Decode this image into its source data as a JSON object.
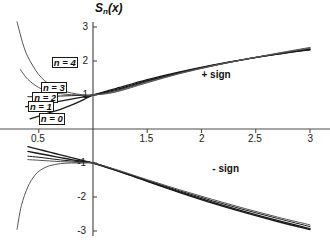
{
  "chart_data": {
    "type": "line",
    "title_parts": {
      "base": "S",
      "sub": "n",
      "arg": "(x)"
    },
    "xlabel": "",
    "ylabel": "S_n(x)",
    "xlim": [
      0.35,
      3.1
    ],
    "ylim": [
      -3.2,
      3.2
    ],
    "grid": false,
    "legend_position": "inline-left",
    "x_ticks": [
      {
        "value": 0.5,
        "label": "0.5"
      },
      {
        "value": 1.5,
        "label": "1.5"
      },
      {
        "value": 2.0,
        "label": "2"
      },
      {
        "value": 2.5,
        "label": "2.5"
      },
      {
        "value": 3.0,
        "label": "3"
      }
    ],
    "y_ticks": [
      {
        "value": 3,
        "label": "3"
      },
      {
        "value": 2,
        "label": "2"
      },
      {
        "value": 1,
        "label": "1"
      },
      {
        "value": -1,
        "label": "-1"
      },
      {
        "value": -2,
        "label": "-2"
      },
      {
        "value": -3,
        "label": "-3"
      }
    ],
    "annotations": [
      {
        "name": "plus-sign-label",
        "text": "+ sign",
        "x": 2.0,
        "y": 1.55
      },
      {
        "name": "minus-sign-label",
        "text": "- sign",
        "x": 2.1,
        "y": -1.2
      }
    ],
    "curve_labels": [
      {
        "name": "n4",
        "text": "n = 4",
        "x": 0.62,
        "y": 1.95
      },
      {
        "name": "n3",
        "text": "n = 3",
        "x": 0.52,
        "y": 1.22
      },
      {
        "name": "n2",
        "text": "n = 2",
        "x": 0.44,
        "y": 0.92
      },
      {
        "name": "n1",
        "text": "n = 1",
        "x": 0.4,
        "y": 0.66
      },
      {
        "name": "n0",
        "text": "n = 0",
        "x": 0.5,
        "y": 0.28
      }
    ],
    "series": [
      {
        "name": "n = 0 (+ sign)",
        "branch": "plus",
        "n": 0,
        "x": [
          0.42,
          0.5,
          0.6,
          0.7,
          0.8,
          0.9,
          1.0,
          1.2,
          1.5,
          1.8,
          2.1,
          2.4,
          2.7,
          3.0
        ],
        "y": [
          0.3,
          0.38,
          0.48,
          0.58,
          0.7,
          0.84,
          1.0,
          1.18,
          1.45,
          1.68,
          1.88,
          2.05,
          2.2,
          2.33
        ]
      },
      {
        "name": "n = 1 (+ sign)",
        "branch": "plus",
        "n": 1,
        "x": [
          0.38,
          0.5,
          0.6,
          0.7,
          0.8,
          0.9,
          1.0,
          1.2,
          1.5,
          1.8,
          2.1,
          2.4,
          2.7,
          3.0
        ],
        "y": [
          0.66,
          0.7,
          0.76,
          0.82,
          0.88,
          0.94,
          1.0,
          1.15,
          1.42,
          1.66,
          1.87,
          2.05,
          2.2,
          2.34
        ]
      },
      {
        "name": "n = 2 (+ sign)",
        "branch": "plus",
        "n": 2,
        "x": [
          0.4,
          0.5,
          0.6,
          0.7,
          0.8,
          0.9,
          1.0,
          1.2,
          1.5,
          1.8,
          2.1,
          2.4,
          2.7,
          3.0
        ],
        "y": [
          0.95,
          0.95,
          0.96,
          0.97,
          0.98,
          0.99,
          1.0,
          1.12,
          1.4,
          1.65,
          1.86,
          2.05,
          2.21,
          2.36
        ]
      },
      {
        "name": "n = 3 (+ sign)",
        "branch": "plus",
        "n": 3,
        "x": [
          0.33,
          0.4,
          0.5,
          0.6,
          0.7,
          0.8,
          0.9,
          1.0,
          1.2,
          1.5,
          1.8,
          2.1,
          2.4,
          2.7,
          3.0
        ],
        "y": [
          1.75,
          1.46,
          1.22,
          1.1,
          1.04,
          1.01,
          1.0,
          1.0,
          1.1,
          1.38,
          1.64,
          1.86,
          2.05,
          2.22,
          2.38
        ]
      },
      {
        "name": "n = 4 (+ sign)",
        "branch": "plus",
        "n": 4,
        "x": [
          0.3,
          0.35,
          0.4,
          0.5,
          0.6,
          0.7,
          0.8,
          0.9,
          1.0,
          1.2,
          1.5,
          1.8,
          2.1,
          2.4,
          2.7,
          3.0
        ],
        "y": [
          3.15,
          2.55,
          2.12,
          1.6,
          1.31,
          1.15,
          1.06,
          1.01,
          1.0,
          1.08,
          1.36,
          1.63,
          1.85,
          2.05,
          2.23,
          2.4
        ]
      },
      {
        "name": "n = 0 (- sign)",
        "branch": "minus",
        "n": 0,
        "x": [
          0.4,
          0.5,
          0.6,
          0.7,
          0.8,
          0.9,
          1.0,
          1.2,
          1.5,
          1.8,
          2.1,
          2.4,
          2.7,
          3.0
        ],
        "y": [
          -0.52,
          -0.6,
          -0.68,
          -0.76,
          -0.84,
          -0.92,
          -1.0,
          -1.2,
          -1.54,
          -1.87,
          -2.18,
          -2.46,
          -2.72,
          -2.96
        ]
      },
      {
        "name": "n = 1 (- sign)",
        "branch": "minus",
        "n": 1,
        "x": [
          0.4,
          0.5,
          0.6,
          0.7,
          0.8,
          0.9,
          1.0,
          1.2,
          1.5,
          1.8,
          2.1,
          2.4,
          2.7,
          3.0
        ],
        "y": [
          -0.66,
          -0.72,
          -0.78,
          -0.84,
          -0.9,
          -0.95,
          -1.0,
          -1.2,
          -1.53,
          -1.85,
          -2.15,
          -2.43,
          -2.69,
          -2.93
        ]
      },
      {
        "name": "n = 2 (- sign)",
        "branch": "minus",
        "n": 2,
        "x": [
          0.4,
          0.5,
          0.6,
          0.7,
          0.8,
          0.9,
          1.0,
          1.2,
          1.5,
          1.8,
          2.1,
          2.4,
          2.7,
          3.0
        ],
        "y": [
          -0.8,
          -0.83,
          -0.87,
          -0.91,
          -0.94,
          -0.97,
          -1.0,
          -1.19,
          -1.51,
          -1.82,
          -2.11,
          -2.38,
          -2.63,
          -2.87
        ]
      },
      {
        "name": "n = 3 (- sign)",
        "branch": "minus",
        "n": 3,
        "x": [
          0.4,
          0.5,
          0.6,
          0.7,
          0.8,
          0.9,
          1.0,
          1.2,
          1.5,
          1.8,
          2.1,
          2.4,
          2.7,
          3.0
        ],
        "y": [
          -0.9,
          -0.92,
          -0.94,
          -0.96,
          -0.97,
          -0.99,
          -1.0,
          -1.18,
          -1.49,
          -1.79,
          -2.07,
          -2.34,
          -2.59,
          -2.82
        ]
      },
      {
        "name": "n = 4 (- sign, divergent)",
        "branch": "minus",
        "n": 4,
        "x": [
          0.3,
          0.34,
          0.4,
          0.46,
          0.52,
          0.6,
          0.7,
          0.8,
          0.9,
          1.0
        ],
        "y": [
          -2.95,
          -2.25,
          -1.7,
          -1.38,
          -1.2,
          -1.08,
          -1.02,
          -1.0,
          -1.0,
          -1.0
        ]
      }
    ]
  },
  "colors": {
    "axis": "#4d4d4d",
    "curve": "#1a1a1a",
    "curve_light": "#555555",
    "text": "#111111",
    "background": "#ffffff"
  }
}
